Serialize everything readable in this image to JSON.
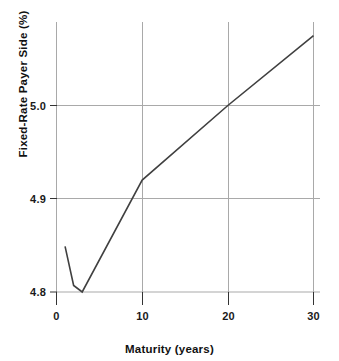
{
  "chart_data": {
    "type": "line",
    "title": "",
    "subtitle": "",
    "xlabel": "Maturity (years)",
    "ylabel": "Fixed-Rate Payer Side (%)",
    "xlim": [
      -1.5,
      31
    ],
    "ylim": [
      4.785,
      5.085
    ],
    "grid": true,
    "legend": null,
    "xticks": [
      0,
      10,
      20,
      30
    ],
    "xtick_labels": [
      "0",
      "10",
      "20",
      "30"
    ],
    "yticks": [
      4.8,
      4.9,
      5.0
    ],
    "ytick_labels": [
      "4.8",
      "4.9",
      "5.0"
    ],
    "series": [
      {
        "name": "Swap curve",
        "x": [
          1,
          2,
          3,
          10,
          20,
          30
        ],
        "values": [
          4.849,
          4.807,
          4.8,
          4.92,
          5.0,
          5.075
        ],
        "color": "#404040",
        "line_width": 1.6,
        "marker": "none"
      }
    ],
    "annotations": []
  },
  "style": {
    "background": "#ffffff",
    "grid_color": "#a9a9a9",
    "axis_color": "#4d4d4d",
    "text_color": "#111111",
    "line_color": "#404040"
  }
}
